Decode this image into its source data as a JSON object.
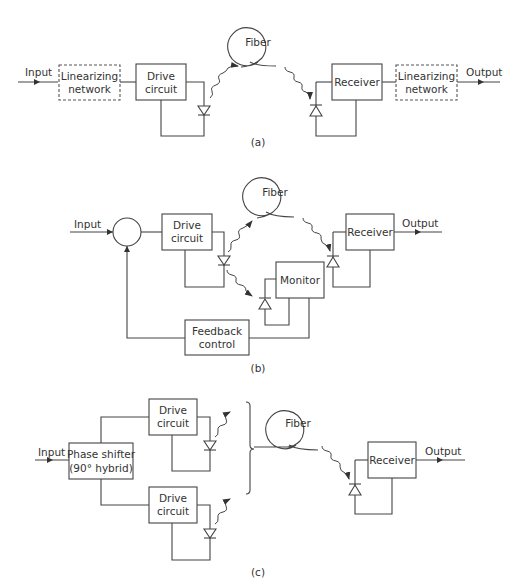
{
  "diagram_a": {
    "caption": "(a)",
    "input_label": "Input",
    "output_label": "Output",
    "lin_in": {
      "line1": "Linearizing",
      "line2": "network"
    },
    "drive": {
      "line1": "Drive",
      "line2": "circuit"
    },
    "fiber": "Fiber",
    "receiver": "Receiver",
    "lin_out": {
      "line1": "Linearizing",
      "line2": "network"
    }
  },
  "diagram_b": {
    "caption": "(b)",
    "input_label": "Input",
    "output_label": "Output",
    "drive": {
      "line1": "Drive",
      "line2": "circuit"
    },
    "fiber": "Fiber",
    "receiver": "Receiver",
    "monitor": "Monitor",
    "feedback": {
      "line1": "Feedback",
      "line2": "control"
    }
  },
  "diagram_c": {
    "caption": "(c)",
    "input_label": "Input",
    "output_label": "Output",
    "phase": {
      "line1": "Phase shifter",
      "line2": "(90° hybrid)"
    },
    "drive_top": {
      "line1": "Drive",
      "line2": "circuit"
    },
    "drive_bottom": {
      "line1": "Drive",
      "line2": "circuit"
    },
    "fiber": "Fiber",
    "receiver": "Receiver"
  },
  "colors": {
    "stroke": "#444444",
    "text": "#333333",
    "background": "#ffffff"
  }
}
